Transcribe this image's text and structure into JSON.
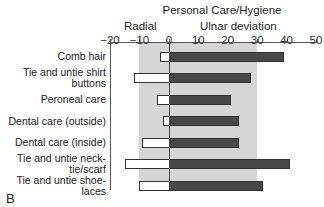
{
  "chart_data": {
    "type": "bar",
    "orientation": "horizontal",
    "title": "Personal Care/Hygiene",
    "panel_label": "B",
    "annotations": {
      "left": "Radial",
      "right": "Ulnar deviation"
    },
    "xlim": [
      -20,
      50
    ],
    "x_ticks": [
      "−20",
      "−10",
      "0",
      "10",
      "20",
      "30",
      "40",
      "50"
    ],
    "x_tick_values": [
      -20,
      -10,
      0,
      10,
      20,
      30,
      40,
      50
    ],
    "shaded_range": [
      -10,
      30
    ],
    "categories": [
      "Comb hair",
      "Tie and untie shirt buttons",
      "Peroneal care",
      "Dental care (outside)",
      "Dental care (inside)",
      "Tie and untie neck-tie/scarf",
      "Tie and untie shoe-laces"
    ],
    "series": [
      {
        "name": "Radial deviation",
        "color": "#ffffff",
        "values": [
          -3,
          -12,
          -4,
          -2,
          -9,
          -15,
          -10
        ]
      },
      {
        "name": "Ulnar deviation",
        "color": "#484848",
        "values": [
          39,
          28,
          21,
          24,
          24,
          41,
          32
        ]
      }
    ],
    "grid": false,
    "legend": null
  },
  "labels": {
    "title": "Personal Care/Hygiene",
    "radial": "Radial",
    "ulnar": "Ulnar deviation",
    "panel": "B",
    "cat": [
      [
        "Comb hair"
      ],
      [
        "Tie and untie shirt",
        "buttons"
      ],
      [
        "Peroneal care"
      ],
      [
        "Dental care (outside)"
      ],
      [
        "Dental care (inside)"
      ],
      [
        "Tie and untie neck-",
        "tie/scarf"
      ],
      [
        "Tie and untie shoe-",
        "laces"
      ]
    ]
  }
}
